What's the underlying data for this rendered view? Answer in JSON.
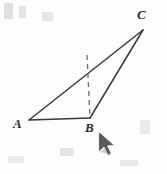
{
  "figure": {
    "kind": "geometry-diagram",
    "background_color": "#fdfdfd",
    "stroke_color": "#3a3a40",
    "dash_color": "#6d6d73",
    "labels": {
      "a": "A",
      "b": "B",
      "c": "C"
    },
    "vertices": {
      "A": {
        "x": 29,
        "y": 120
      },
      "B": {
        "x": 90,
        "y": 118
      },
      "C": {
        "x": 143,
        "y": 30
      }
    },
    "segments": [
      {
        "name": "AB",
        "from": "A",
        "to": "B"
      },
      {
        "name": "AC",
        "from": "A",
        "to": "C"
      },
      {
        "name": "BC",
        "from": "B",
        "to": "C"
      }
    ],
    "dashed_line": {
      "name": "altitude-from-B",
      "x1": 87,
      "y1": 55,
      "x2": 90,
      "y2": 118,
      "dash_pattern": "5 4"
    }
  },
  "cursor": {
    "name": "mouse-pointer",
    "x": 98,
    "y": 131,
    "fill": "#5a5a60",
    "outline": "#ffffff"
  }
}
